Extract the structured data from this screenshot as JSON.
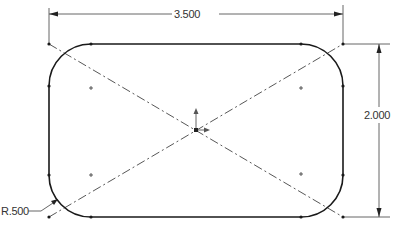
{
  "sketch": {
    "title": "Rounded rectangle sketch with construction diagonals",
    "colors": {
      "geometry": "#1a1a1a",
      "dimension": "#555555",
      "construction": "#444444",
      "text": "#333333",
      "background": "#ffffff"
    },
    "dimensions": {
      "width": {
        "label": "3.500",
        "value": 3.5
      },
      "height": {
        "label": "2.000",
        "value": 2.0
      },
      "radius": {
        "label": "R.500",
        "value": 0.5
      }
    },
    "features": {
      "corner_radius_count": 4,
      "construction_lines": 2,
      "arc_center_marks": 4,
      "origin_marker": "origin-icon"
    }
  }
}
